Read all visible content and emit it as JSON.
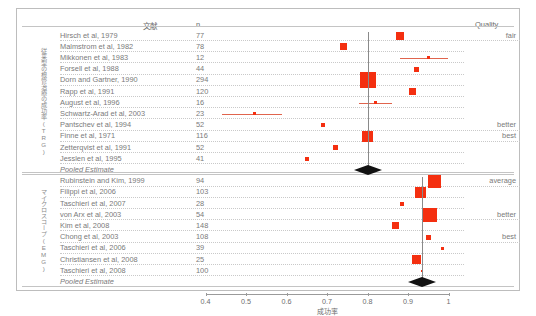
{
  "chart_data": {
    "type": "scatter",
    "title": "",
    "xlabel": "成功率",
    "ylabel": "",
    "xlim": [
      0.4,
      1.0
    ],
    "xticks": [
      "0.4",
      "0.5",
      "0.6",
      "0.7",
      "0.8",
      "0.9",
      "1"
    ],
    "grid": false,
    "legend": "none",
    "columns": [
      "文献",
      "n",
      "Quality"
    ],
    "groups": [
      {
        "id": "group-trg",
        "side_label": "従来型の根管治療の成功率(TRG)",
        "pooled_estimate": 0.8,
        "pooled_label": "Pooled Estimate",
        "rows": [
          {
            "study": "Hirsch et al, 1979",
            "n": "77",
            "value": 0.88,
            "lo": 0.88,
            "hi": 0.88,
            "size": 8,
            "quality": "fair"
          },
          {
            "study": "Malmstrom et al, 1982",
            "n": "78",
            "value": 0.74,
            "lo": 0.74,
            "hi": 0.74,
            "size": 7,
            "quality": ""
          },
          {
            "study": "Mikkonen et al, 1983",
            "n": "12",
            "value": 0.95,
            "lo": 0.88,
            "hi": 1.0,
            "size": 3,
            "quality": ""
          },
          {
            "study": "Forsell et al, 1988",
            "n": "44",
            "value": 0.92,
            "lo": 0.92,
            "hi": 0.92,
            "size": 5,
            "quality": ""
          },
          {
            "study": "Dorn and Gartner, 1990",
            "n": "294",
            "value": 0.8,
            "lo": 0.8,
            "hi": 0.8,
            "size": 16,
            "quality": ""
          },
          {
            "study": "Rapp et al, 1991",
            "n": "120",
            "value": 0.91,
            "lo": 0.91,
            "hi": 0.91,
            "size": 7,
            "quality": ""
          },
          {
            "study": "August et al, 1996",
            "n": "16",
            "value": 0.82,
            "lo": 0.78,
            "hi": 0.86,
            "size": 3,
            "quality": ""
          },
          {
            "study": "Schwartz-Arad et al, 2003",
            "n": "23",
            "value": 0.52,
            "lo": 0.44,
            "hi": 0.59,
            "size": 3,
            "quality": ""
          },
          {
            "study": "Pantschev et al, 1994",
            "n": "52",
            "value": 0.69,
            "lo": 0.69,
            "hi": 0.69,
            "size": 4,
            "quality": "better"
          },
          {
            "study": "Finne et al, 1971",
            "n": "116",
            "value": 0.8,
            "lo": 0.8,
            "hi": 0.8,
            "size": 11,
            "quality": "best"
          },
          {
            "study": "Zetterqvist et al, 1991",
            "n": "52",
            "value": 0.72,
            "lo": 0.72,
            "hi": 0.72,
            "size": 5,
            "quality": ""
          },
          {
            "study": "Jesslen et al, 1995",
            "n": "41",
            "value": 0.65,
            "lo": 0.65,
            "hi": 0.65,
            "size": 4,
            "quality": ""
          }
        ]
      },
      {
        "id": "group-emg",
        "side_label": "マイクロスコープ(EMG)",
        "pooled_estimate": 0.935,
        "pooled_label": "Pooled Estimate",
        "rows": [
          {
            "study": "Rubinstein and Kim, 1999",
            "n": "94",
            "value": 0.965,
            "lo": 0.965,
            "hi": 0.965,
            "size": 13,
            "quality": "average"
          },
          {
            "study": "Filippi et al, 2006",
            "n": "103",
            "value": 0.93,
            "lo": 0.93,
            "hi": 0.93,
            "size": 11,
            "quality": ""
          },
          {
            "study": "Taschieri et al, 2007",
            "n": "28",
            "value": 0.885,
            "lo": 0.885,
            "hi": 0.885,
            "size": 4,
            "quality": ""
          },
          {
            "study": "von Arx et al, 2003",
            "n": "54",
            "value": 0.955,
            "lo": 0.955,
            "hi": 0.955,
            "size": 14,
            "quality": "better"
          },
          {
            "study": "Kim et al, 2008",
            "n": "148",
            "value": 0.87,
            "lo": 0.87,
            "hi": 0.87,
            "size": 7,
            "quality": ""
          },
          {
            "study": "Chong et al, 2003",
            "n": "108",
            "value": 0.95,
            "lo": 0.95,
            "hi": 0.95,
            "size": 5,
            "quality": "best"
          },
          {
            "study": "Taschieri et al, 2006",
            "n": "39",
            "value": 0.985,
            "lo": 0.985,
            "hi": 0.985,
            "size": 3,
            "quality": ""
          },
          {
            "study": "Christiansen  et al, 2008",
            "n": "25",
            "value": 0.92,
            "lo": 0.92,
            "hi": 0.92,
            "size": 9,
            "quality": ""
          },
          {
            "study": "Taschieri et al, 2008",
            "n": "100",
            "value": 0.935,
            "lo": 0.935,
            "hi": 0.935,
            "size": 2,
            "quality": ""
          }
        ]
      }
    ]
  },
  "header": {
    "literature": "文献",
    "n": "n",
    "quality": "Quality"
  },
  "axis": {
    "title": "成功率",
    "ticks": [
      "0.4",
      "0.5",
      "0.6",
      "0.7",
      "0.8",
      "0.9",
      "1"
    ]
  }
}
